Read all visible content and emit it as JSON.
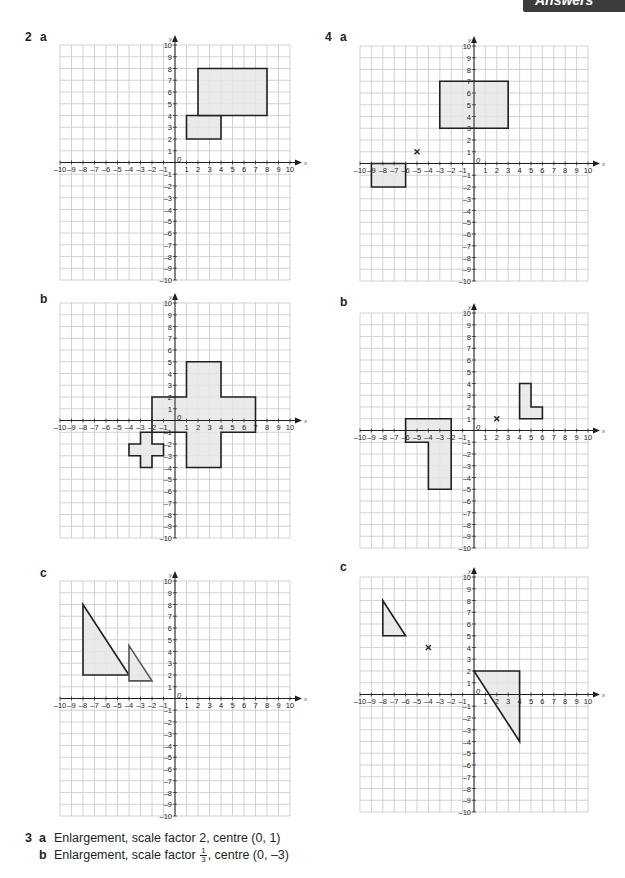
{
  "header_tab": {
    "label": "Answers"
  },
  "question2": {
    "number": "2",
    "parts": {
      "a": {
        "label": "a"
      },
      "b": {
        "label": "b"
      },
      "c": {
        "label": "c"
      }
    }
  },
  "question4": {
    "number": "4",
    "parts": {
      "a": {
        "label": "a"
      },
      "b": {
        "label": "b"
      },
      "c": {
        "label": "c"
      }
    }
  },
  "question3": {
    "number": "3",
    "answers": [
      {
        "label": "a",
        "text": "Enlargement, scale factor 2, centre (0, 1)"
      },
      {
        "label": "b",
        "text_before": "Enlargement, scale factor ",
        "frac_num": "1",
        "frac_den": "3",
        "text_after": ", centre (0, –3)"
      }
    ]
  },
  "axis": {
    "x_label": "x",
    "y_label": "y",
    "origin_label": "0",
    "x_ticks": [
      "–10",
      "–9",
      "–8",
      "–7",
      "–6",
      "–5",
      "–4",
      "–3",
      "–2",
      "–1",
      "1",
      "2",
      "3",
      "4",
      "5",
      "6",
      "7",
      "8",
      "9",
      "10"
    ],
    "y_ticks": [
      "10",
      "9",
      "8",
      "7",
      "6",
      "5",
      "4",
      "3",
      "2",
      "1",
      "–1",
      "–2",
      "–3",
      "–4",
      "–5",
      "–6",
      "–7",
      "–8",
      "–9",
      "–10"
    ],
    "range": [
      -10,
      10
    ]
  },
  "colors": {
    "grid": "#c8c8c8",
    "axis": "#231f20",
    "shape_fill": "#e6e6e6",
    "shape_stroke": "#231f20",
    "image_stroke": "#555555",
    "tab_bg": "#3c3c3c"
  },
  "chart_data": [
    {
      "type": "coordinate-grid",
      "title": "2 a",
      "xlim": [
        -10,
        10
      ],
      "ylim": [
        -10,
        10
      ],
      "grid": true,
      "shapes": [
        {
          "name": "object-rectangle",
          "points": [
            [
              1,
              2
            ],
            [
              4,
              2
            ],
            [
              4,
              4
            ],
            [
              1,
              4
            ]
          ]
        },
        {
          "name": "image-rectangle",
          "points": [
            [
              2,
              4
            ],
            [
              8,
              4
            ],
            [
              8,
              8
            ],
            [
              2,
              8
            ]
          ]
        }
      ]
    },
    {
      "type": "coordinate-grid",
      "title": "2 b",
      "xlim": [
        -10,
        10
      ],
      "ylim": [
        -10,
        10
      ],
      "grid": true,
      "shapes": [
        {
          "name": "image-cross",
          "points": [
            [
              -2,
              2
            ],
            [
              1,
              2
            ],
            [
              1,
              5
            ],
            [
              4,
              5
            ],
            [
              4,
              2
            ],
            [
              7,
              2
            ],
            [
              7,
              -1
            ],
            [
              4,
              -1
            ],
            [
              4,
              -4
            ],
            [
              1,
              -4
            ],
            [
              1,
              -1
            ],
            [
              -2,
              -1
            ]
          ]
        },
        {
          "name": "object-cross",
          "points": [
            [
              -3,
              -1
            ],
            [
              -2,
              -1
            ],
            [
              -2,
              -2
            ],
            [
              -1,
              -2
            ],
            [
              -1,
              -3
            ],
            [
              -2,
              -3
            ],
            [
              -2,
              -4
            ],
            [
              -3,
              -4
            ],
            [
              -3,
              -3
            ],
            [
              -4,
              -3
            ],
            [
              -4,
              -2
            ],
            [
              -3,
              -2
            ]
          ]
        }
      ]
    },
    {
      "type": "coordinate-grid",
      "title": "2 c",
      "xlim": [
        -10,
        10
      ],
      "ylim": [
        -10,
        10
      ],
      "grid": true,
      "shapes": [
        {
          "name": "object-triangle",
          "points": [
            [
              -8,
              8
            ],
            [
              -8,
              2
            ],
            [
              -4,
              2
            ]
          ]
        },
        {
          "name": "image-triangle",
          "points": [
            [
              -4,
              4.5
            ],
            [
              -4,
              1.5
            ],
            [
              -2,
              1.5
            ]
          ]
        }
      ]
    },
    {
      "type": "coordinate-grid",
      "title": "4 a",
      "xlim": [
        -10,
        10
      ],
      "ylim": [
        -10,
        10
      ],
      "grid": true,
      "shapes": [
        {
          "name": "large-rectangle",
          "points": [
            [
              -3,
              3
            ],
            [
              3,
              3
            ],
            [
              3,
              7
            ],
            [
              -3,
              7
            ]
          ]
        },
        {
          "name": "small-rectangle",
          "points": [
            [
              -9,
              0
            ],
            [
              -6,
              0
            ],
            [
              -6,
              -2
            ],
            [
              -9,
              -2
            ]
          ]
        }
      ],
      "centre_mark": [
        -5,
        1
      ]
    },
    {
      "type": "coordinate-grid",
      "title": "4 b",
      "xlim": [
        -10,
        10
      ],
      "ylim": [
        -10,
        10
      ],
      "grid": true,
      "shapes": [
        {
          "name": "object-l-shape",
          "points": [
            [
              4,
              4
            ],
            [
              5,
              4
            ],
            [
              5,
              2
            ],
            [
              6,
              2
            ],
            [
              6,
              1
            ],
            [
              4,
              1
            ]
          ]
        },
        {
          "name": "image-l-shape",
          "points": [
            [
              -6,
              1
            ],
            [
              -2,
              1
            ],
            [
              -2,
              -5
            ],
            [
              -4,
              -5
            ],
            [
              -4,
              -1
            ],
            [
              -6,
              -1
            ]
          ]
        }
      ],
      "centre_mark": [
        2,
        1
      ]
    },
    {
      "type": "coordinate-grid",
      "title": "4 c",
      "xlim": [
        -10,
        10
      ],
      "ylim": [
        -10,
        10
      ],
      "grid": true,
      "shapes": [
        {
          "name": "object-triangle",
          "points": [
            [
              -8,
              8
            ],
            [
              -8,
              5
            ],
            [
              -6,
              5
            ]
          ]
        },
        {
          "name": "image-triangle",
          "points": [
            [
              0,
              2
            ],
            [
              4,
              2
            ],
            [
              4,
              -4
            ]
          ]
        }
      ],
      "centre_mark": [
        -4,
        4
      ]
    }
  ]
}
